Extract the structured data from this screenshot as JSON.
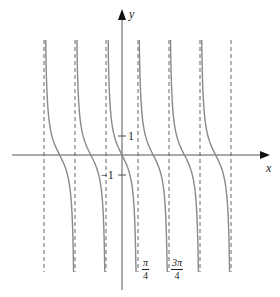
{
  "figure": {
    "function": "y = -tan(2x)",
    "axis_labels": {
      "x": "x",
      "y": "y"
    },
    "y_ticks": [
      {
        "value": 1,
        "label": "1"
      },
      {
        "value": -1,
        "label": "−1"
      }
    ],
    "x_tick_labels": [
      {
        "value": "pi/4",
        "numerator": "π",
        "denominator": "4"
      },
      {
        "value": "3pi/4",
        "numerator": "3π",
        "denominator": "4"
      }
    ],
    "asymptotes": [
      "-5pi/4",
      "-3pi/4",
      "-pi/4",
      "pi/4",
      "3pi/4",
      "5pi/4",
      "7pi/4"
    ],
    "colors": {
      "curve": "#8a8a8a",
      "axis": "#555555",
      "asymptote": "#666666",
      "text": "#222222"
    }
  }
}
